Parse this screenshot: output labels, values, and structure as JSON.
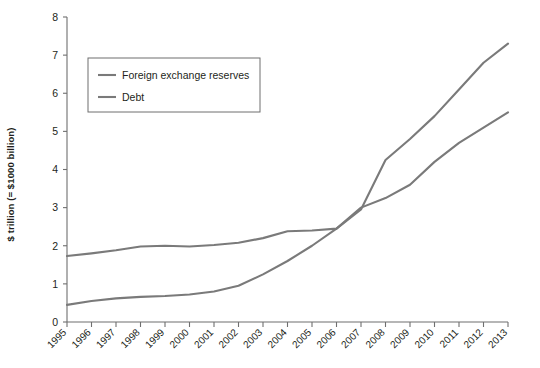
{
  "chart_data": {
    "type": "line",
    "title": "",
    "xlabel": "",
    "ylabel": "$ trillion (= $1000 billion)",
    "xlim": [
      1995,
      2013
    ],
    "ylim": [
      0,
      8
    ],
    "grid": false,
    "legend_position": "upper-left",
    "x": [
      1995,
      1996,
      1997,
      1998,
      1999,
      2000,
      2001,
      2002,
      2003,
      2004,
      2005,
      2006,
      2007,
      2008,
      2009,
      2010,
      2011,
      2012,
      2013
    ],
    "categories": [
      "1995",
      "1996",
      "1997",
      "1998",
      "1999",
      "2000",
      "2001",
      "2002",
      "2003",
      "2004",
      "2005",
      "2006",
      "2007",
      "2008",
      "2009",
      "2010",
      "2011",
      "2012",
      "2013"
    ],
    "ytick_labels": [
      "0",
      "1",
      "2",
      "3",
      "4",
      "5",
      "6",
      "7",
      "8"
    ],
    "ytick_values": [
      0,
      1,
      2,
      3,
      4,
      5,
      6,
      7,
      8
    ],
    "series": [
      {
        "name": "Foreign exchange reserves",
        "color": "#7a7a7a",
        "values": [
          0.45,
          0.55,
          0.62,
          0.66,
          0.68,
          0.72,
          0.8,
          0.95,
          1.25,
          1.6,
          2.0,
          2.45,
          3.0,
          3.25,
          3.6,
          4.2,
          4.7,
          5.1,
          5.5
        ]
      },
      {
        "name": "Debt",
        "color": "#7a7a7a",
        "values": [
          1.73,
          1.8,
          1.88,
          1.98,
          2.0,
          1.98,
          2.02,
          2.08,
          2.2,
          2.38,
          2.4,
          2.45,
          2.95,
          4.25,
          4.8,
          5.4,
          6.1,
          6.8,
          7.3
        ]
      }
    ],
    "legend": [
      {
        "label": "Foreign exchange reserves",
        "color": "#7a7a7a"
      },
      {
        "label": "Debt",
        "color": "#7a7a7a"
      }
    ]
  },
  "axis": {
    "y_title": "$ trillion (= $1000 billion)"
  }
}
